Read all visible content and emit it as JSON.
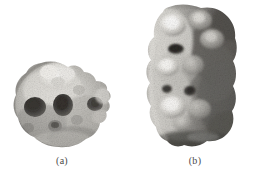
{
  "figure": {
    "background_color": "#ffffff",
    "layout": "two-panel photographic plate, grayscale specimens side by side",
    "panels": [
      {
        "id": "a",
        "caption": "(a)",
        "specimen_type": "photograph",
        "description": "roughly rounded irregular nodular specimen with several dark circular pits and a knobby protrusion on the right side",
        "tone_range": "light gray to dark gray",
        "orientation": "wider than tall"
      },
      {
        "id": "b",
        "caption": "(b)",
        "specimen_type": "photograph",
        "description": "vertically elongated columnar fragment with bright raised nodules along the left side, dark shaded right side and a notched lower edge",
        "tone_range": "white highlights to near black",
        "orientation": "taller than wide"
      }
    ],
    "caption_color": "#4a4a4a"
  }
}
